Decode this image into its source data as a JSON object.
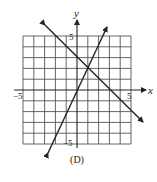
{
  "figure": {
    "caption": "(D)",
    "axes": {
      "x_label": "x",
      "y_label": "y",
      "x_tick_neg": "−5",
      "x_tick_pos": "5",
      "y_tick_pos": "5",
      "y_tick_neg": "−5",
      "range": [
        -5,
        5
      ],
      "grid": true
    },
    "lines": [
      {
        "name": "descending-line",
        "description": "line with negative slope, y-intercept about 3, x-intercept about 3",
        "start": [
          -3,
          6
        ],
        "end": [
          6,
          -3
        ]
      },
      {
        "name": "ascending-line",
        "description": "steep line with positive slope about 2",
        "start": [
          -2.7,
          -5.8
        ],
        "end": [
          2.8,
          5.8
        ]
      }
    ],
    "colors": {
      "line": "#222222",
      "grid": "#444444",
      "background": "#ffffff"
    }
  }
}
